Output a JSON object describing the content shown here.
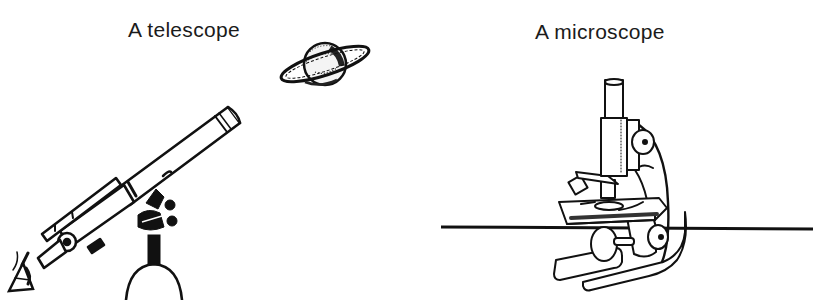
{
  "figure": {
    "panels": [
      {
        "caption": "A telescope",
        "illustration": "telescope-icon",
        "extras": [
          "planet-saturn-icon",
          "eye-icon"
        ]
      },
      {
        "caption": "A microscope",
        "illustration": "microscope-icon",
        "extras": [
          "table-surface-line"
        ]
      }
    ]
  },
  "colors": {
    "ink": "#1a1a1a",
    "background": "#ffffff"
  }
}
